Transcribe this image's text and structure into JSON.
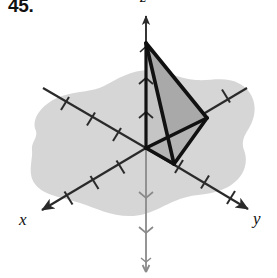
{
  "figure": {
    "problem_number": "45.",
    "type": "3d-coordinate-diagram"
  },
  "axes": {
    "x": {
      "label": "x",
      "direction": "lower-left",
      "tick_count": 4
    },
    "y": {
      "label": "y",
      "direction": "lower-right",
      "tick_count": 4
    },
    "z": {
      "label": "z",
      "direction": "up",
      "tick_count_positive": 3,
      "tick_count_negative": 3
    }
  },
  "colors": {
    "plane_fill": "#d6d6d6",
    "face_light": "#c9c9c9",
    "face_dark": "#a8a8a8",
    "face_mid": "#b8b8b8",
    "axis_line": "#2a2a2a",
    "axis_line_faint": "#8a8a8a",
    "solid_edge": "#111111",
    "text": "#111111"
  },
  "geometry": {
    "origin": [
      146,
      148
    ],
    "vertices": {
      "apex_on_z_axis": [
        146,
        43
      ],
      "on_y_axis": [
        207,
        118
      ],
      "front_lower": [
        174,
        164
      ],
      "origin": [
        146,
        148
      ]
    },
    "z_axis_top": [
      146,
      12
    ],
    "z_axis_bottom": [
      146,
      274
    ],
    "x_axis_tip": [
      40,
      212
    ],
    "y_axis_tip": [
      250,
      211
    ]
  }
}
